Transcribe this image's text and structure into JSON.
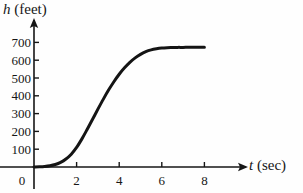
{
  "chart_data": {
    "type": "line",
    "title": "",
    "xlabel": "t (sec)",
    "xlabel_variable": "t",
    "xlabel_units": "(sec)",
    "ylabel": "h (feet)",
    "ylabel_variable": "h",
    "ylabel_units": "(feet)",
    "xlim": [
      0,
      8.6
    ],
    "ylim": [
      0,
      760
    ],
    "grid": false,
    "legend": null,
    "xticks": [
      0,
      2,
      4,
      6,
      8
    ],
    "xtick_labels": [
      "0",
      "2",
      "4",
      "6",
      "8"
    ],
    "yticks": [
      100,
      200,
      300,
      400,
      500,
      600,
      700
    ],
    "ytick_labels": [
      "100",
      "200",
      "300",
      "400",
      "500",
      "600",
      "700"
    ],
    "origin_label": "0",
    "series": [
      {
        "name": "h(t)",
        "color": "#141414",
        "x": [
          0.0,
          0.25,
          0.5,
          0.75,
          1.0,
          1.25,
          1.5,
          1.75,
          2.0,
          2.25,
          2.5,
          2.75,
          3.0,
          3.25,
          3.5,
          3.75,
          4.0,
          4.25,
          4.5,
          4.75,
          5.0,
          5.25,
          5.5,
          5.75,
          6.0,
          6.25,
          6.5,
          6.75,
          7.0,
          7.25,
          7.5,
          7.75,
          8.0
        ],
        "y": [
          0,
          1,
          3,
          7,
          14,
          26,
          45,
          72,
          110,
          158,
          212,
          268,
          325,
          380,
          432,
          479,
          521,
          557,
          588,
          613,
          633,
          648,
          658,
          664,
          668,
          670,
          671,
          672,
          672,
          673,
          673,
          673,
          673
        ]
      }
    ],
    "axis_color": "#161616",
    "curve_width": 3.0,
    "background": "#fefefe"
  },
  "geometry": {
    "origin_px": {
      "x": 34,
      "y": 167
    },
    "x_per_unit_px": 21.3,
    "y_per_100_px": 17.8,
    "x_axis_arrow_end_px": 246,
    "y_axis_arrow_end_px": 20,
    "tick_len_px": 5
  }
}
